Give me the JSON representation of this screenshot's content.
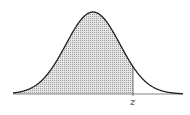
{
  "chart_data": {
    "type": "area",
    "title": "",
    "xlabel": "",
    "ylabel": "",
    "tick_labels": [
      "z"
    ],
    "shaded_region": "left of z",
    "z_position_sd": 0.9,
    "grid": false,
    "legend": null
  },
  "labels": {
    "z": "z"
  },
  "colors": {
    "curve": "#222222",
    "shade": "#b8b8b8",
    "baseline": "#666666"
  }
}
